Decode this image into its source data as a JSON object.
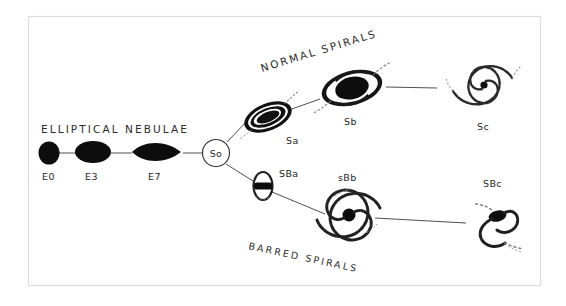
{
  "figure": {
    "background_color": "#ffffff",
    "ink_color": "#0d0d0d",
    "frame_color": "#dcdcdc"
  },
  "headings": {
    "elliptical": "ELLIPTICAL NEBULAE",
    "normal_spirals": "NORMAL SPIRALS",
    "barred_spirals": "BARRED SPIRALS"
  },
  "sequence": {
    "ellipticals": [
      {
        "label": "E0",
        "shape": "round-ellipse"
      },
      {
        "label": "E3",
        "shape": "oval-ellipse"
      },
      {
        "label": "E7",
        "shape": "lens-ellipse"
      }
    ],
    "hub": {
      "label": "So",
      "shape": "circle-outline"
    },
    "normal_branch": [
      {
        "label": "Sa",
        "shape": "tight-spiral-inclined"
      },
      {
        "label": "Sb",
        "shape": "medium-spiral"
      },
      {
        "label": "Sc",
        "shape": "open-spiral"
      }
    ],
    "barred_branch": [
      {
        "label": "SBa",
        "shape": "barred-lens"
      },
      {
        "label": "sBb",
        "shape": "barred-medium-spiral"
      },
      {
        "label": "SBc",
        "shape": "barred-open-spiral"
      }
    ]
  }
}
